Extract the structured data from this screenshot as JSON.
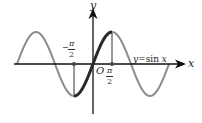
{
  "chart_data": {
    "type": "line",
    "title": "",
    "xlabel": "x",
    "ylabel": "y",
    "origin_label": "O",
    "series": [
      {
        "name": "y=sin x",
        "function": "sin(x)",
        "x_range": [
          "-2π",
          "2π"
        ],
        "color": "#8c8c8c",
        "x": [
          -6.283,
          -4.712,
          -3.142,
          -1.571,
          0,
          1.571,
          3.142,
          4.712,
          6.283
        ],
        "values": [
          0,
          1,
          0,
          -1,
          0,
          1,
          0,
          -1,
          0
        ]
      },
      {
        "name": "highlighted segment",
        "function": "sin(x)",
        "x_range": [
          "-π/2",
          "π/2"
        ],
        "color": "#2a2a2a",
        "x": [
          -1.571,
          0,
          1.571
        ],
        "values": [
          -1,
          0,
          1
        ]
      }
    ],
    "tick_labels": [
      {
        "x": "-π/2",
        "numerator": "π",
        "denominator": "2",
        "sign": "-"
      },
      {
        "x": "π/2",
        "numerator": "π",
        "denominator": "2",
        "sign": ""
      }
    ],
    "annotations": [
      "y=sin x"
    ],
    "grid": false,
    "legend": "none",
    "colors": {
      "axis": "#111111",
      "curve": "#8c8c8c",
      "highlight": "#2a2a2a",
      "guide": "#555555"
    }
  },
  "labels": {
    "y_axis": "y",
    "x_axis": "x",
    "origin": "O",
    "curve": "y=sin x",
    "neg_half_pi_sign": "−",
    "neg_half_pi_num": "π",
    "neg_half_pi_den": "2",
    "pos_half_pi_num": "π",
    "pos_half_pi_den": "2"
  }
}
